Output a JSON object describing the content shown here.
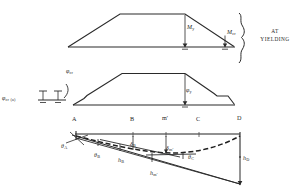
{
  "figure": {
    "title_note": "AT YIELDING",
    "note_lines": [
      "AT",
      "YIELDING"
    ],
    "ink_color": "#1f1f1f",
    "background": "#ffffff"
  },
  "moment_diagram": {
    "name": "bending-moment-diagram",
    "labels": {
      "my": "M",
      "my_sub": "y",
      "mcr": "M",
      "mcr_sub": "cr"
    }
  },
  "curvature_diagram": {
    "name": "curvature-diagram",
    "labels": {
      "phi_cr": "φ",
      "phi_cr_sub": "cr",
      "phi_cr_a": "φ",
      "phi_cr_a_sub": "cr (a)",
      "phi_y": "φ",
      "phi_y_sub": "y"
    }
  },
  "deflection_diagram": {
    "name": "deflected-shape-diagram",
    "stations": [
      {
        "id": "A",
        "label": "A"
      },
      {
        "id": "B",
        "label": "B"
      },
      {
        "id": "m",
        "label": "m'"
      },
      {
        "id": "C",
        "label": "C"
      },
      {
        "id": "D",
        "label": "D"
      }
    ],
    "rotations": [
      {
        "id": "theta-a",
        "sym": "θ",
        "sub": "A"
      },
      {
        "id": "theta-b",
        "sym": "θ",
        "sub": "B"
      },
      {
        "id": "theta-c",
        "sym": "θ",
        "sub": "C"
      }
    ],
    "deflections": [
      {
        "id": "delta-b",
        "sym": "δ",
        "sub": "B"
      },
      {
        "id": "delta-m",
        "sym": "δ",
        "sub": "m'"
      }
    ],
    "heights": [
      {
        "id": "h-b",
        "sym": "h",
        "sub": "B"
      },
      {
        "id": "h-m",
        "sym": "h",
        "sub": "m'"
      },
      {
        "id": "h-d",
        "sym": "h",
        "sub": "D"
      }
    ]
  }
}
